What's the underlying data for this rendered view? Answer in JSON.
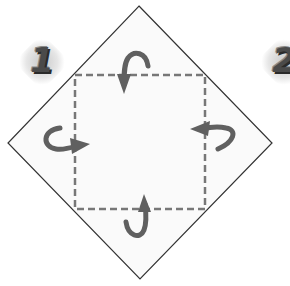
{
  "diagram": {
    "type": "origami-fold-instruction",
    "steps": [
      {
        "number": "1",
        "visible": "full"
      },
      {
        "number": "2",
        "visible": "partial"
      }
    ],
    "paper": {
      "shape": "diamond",
      "vertices": {
        "top": [
          139,
          6
        ],
        "right": [
          272,
          143
        ],
        "bottom": [
          140,
          279
        ],
        "left": [
          8,
          143
        ]
      },
      "stroke_color": "#333333",
      "fill_color": "#fafafa"
    },
    "fold_lines": {
      "style": "dashed",
      "color": "#777777",
      "rect": {
        "x1": 75,
        "y1": 75,
        "x2": 205,
        "y2": 209
      }
    },
    "arrows": [
      {
        "id": "top",
        "direction": "fold-down",
        "color": "#606060"
      },
      {
        "id": "left",
        "direction": "fold-right",
        "color": "#606060"
      },
      {
        "id": "right",
        "direction": "fold-left",
        "color": "#606060"
      },
      {
        "id": "bottom",
        "direction": "fold-up",
        "color": "#606060"
      }
    ]
  }
}
